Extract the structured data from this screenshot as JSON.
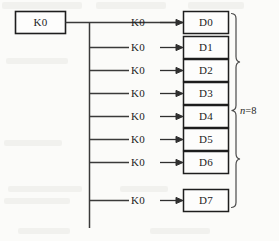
{
  "diagram": {
    "type": "plc-data-distribution-ladder",
    "source_block": {
      "label": "K0",
      "name": "source-constant-block"
    },
    "branches": [
      {
        "operand": "K0",
        "destination": "D0"
      },
      {
        "operand": "K0",
        "destination": "D1"
      },
      {
        "operand": "K0",
        "destination": "D2"
      },
      {
        "operand": "K0",
        "destination": "D3"
      },
      {
        "operand": "K0",
        "destination": "D4"
      },
      {
        "operand": "K0",
        "destination": "D5"
      },
      {
        "operand": "K0",
        "destination": "D6"
      },
      {
        "operand": "K0",
        "destination": "D7"
      }
    ],
    "brace_annotation": {
      "variable": "n",
      "equals": "=",
      "value": "8",
      "full_text": "n=8"
    },
    "colors": {
      "paper": "#fbfbf9",
      "ink": "#2a2a2a",
      "box_border": "#1e1e1e",
      "line": "#3a3a3a",
      "brace": "#4a4a4a"
    }
  }
}
